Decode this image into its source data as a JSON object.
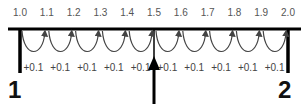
{
  "diagram": {
    "type": "number-line",
    "start": 1.0,
    "end": 2.0,
    "step": 0.1,
    "tick_labels": [
      "1.0",
      "1.1",
      "1.2",
      "1.3",
      "1.4",
      "1.5",
      "1.6",
      "1.7",
      "1.8",
      "1.9",
      "2.0"
    ],
    "step_labels": [
      "+0.1",
      "+0.1",
      "+0.1",
      "+0.1",
      "+0.1",
      "+0.1",
      "+0.1",
      "+0.1",
      "+0.1",
      "+0.1"
    ],
    "end_labels": {
      "left": "1",
      "right": "2"
    },
    "pointer_at": "1.5",
    "colors": {
      "line": "#000000",
      "arc": "#444444",
      "tick_text": "#555555",
      "end_text": "#111111"
    }
  }
}
